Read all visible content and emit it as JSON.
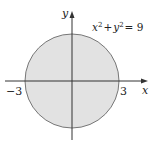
{
  "diagram": {
    "equation": {
      "base1": "x",
      "exp1": "2",
      "plus": "+",
      "base2": "y",
      "exp2": "2",
      "eq": "= 9"
    },
    "axes": {
      "x_label": "x",
      "y_label": "y"
    },
    "ticks": {
      "left": "−3",
      "right": "3"
    },
    "circle": {
      "radius": 3,
      "center": [
        0,
        0
      ],
      "fill": "#e2e2e2",
      "stroke": "#777777"
    },
    "axis_color": "#333333"
  }
}
